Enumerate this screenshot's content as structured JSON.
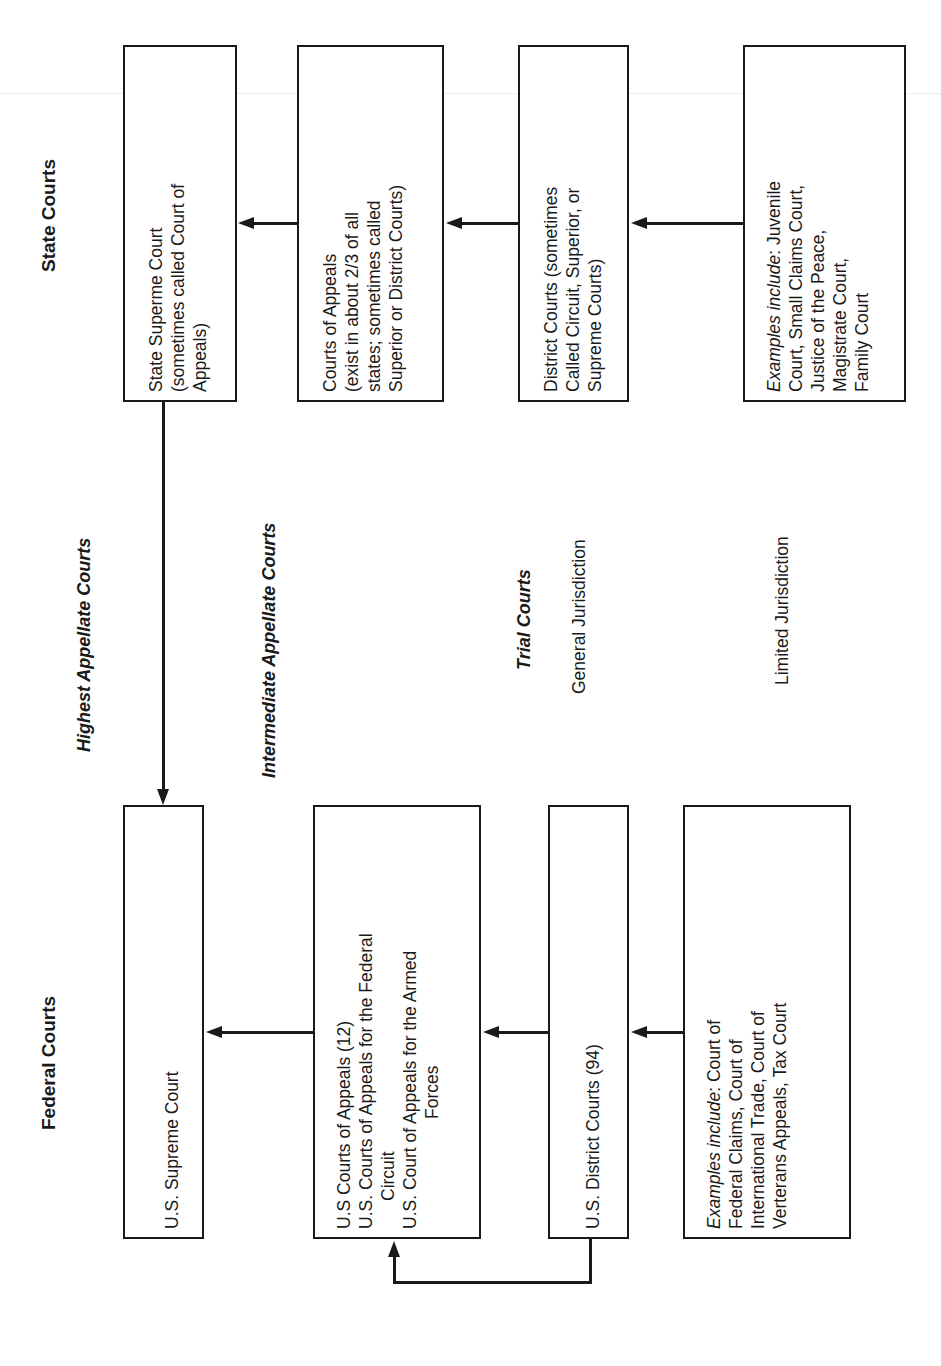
{
  "headings": {
    "federal": "Federal Courts",
    "state": "State Courts"
  },
  "tiers": {
    "highest": "Highest Appellate Courts",
    "intermediate": "Intermediate Appellate Courts",
    "trial": "Trial Courts",
    "general": "General Jurisdiction",
    "limited": "Limited Jurisdiction"
  },
  "federal": {
    "supreme": {
      "lines": [
        "U.S. Supreme Court"
      ]
    },
    "appeals": {
      "lines": [
        "U.S Courts of Appeals (12)",
        "U.S. Courts of Appeals for the Federal",
        "Circuit",
        "U.S. Court of Appeals for the Armed",
        "Forces"
      ]
    },
    "district": {
      "lines": [
        "U.S. District Courts (94)"
      ]
    },
    "limited": {
      "prefix": "Examples include",
      "lines": [
        ": Court of",
        "Federal Claims, Court of",
        "International Trade, Court of",
        "Verterans Appeals, Tax Court"
      ]
    }
  },
  "state": {
    "supreme": {
      "lines": [
        "State Superme Court",
        "(sometimes called Court of",
        "Appeals)"
      ]
    },
    "appeals": {
      "lines": [
        "Courts of Appeals",
        "(exist in about 2/3 of all",
        "states; sometimes called",
        "Superior or District Courts)"
      ]
    },
    "district": {
      "lines": [
        "District Courts (sometimes",
        "Called Circuit, Superior, or",
        "Supreme Courts)"
      ]
    },
    "limited": {
      "prefix": "Examples include",
      "lines": [
        ": Juvenile",
        "Court, Small Claims Court,",
        "Justice of the Peace,",
        "Magistrate Court,",
        "Family Court"
      ]
    }
  },
  "colors": {
    "ink": "#1a1a1a",
    "background": "#ffffff"
  }
}
